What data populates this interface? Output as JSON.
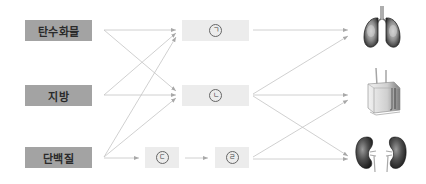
{
  "diagram": {
    "nutrients": [
      {
        "id": "carbohydrate",
        "label": "탄수화물"
      },
      {
        "id": "fat",
        "label": "지방"
      },
      {
        "id": "protein",
        "label": "단백질"
      }
    ],
    "blanks": [
      {
        "id": "giyeok",
        "label": "ㄱ"
      },
      {
        "id": "nieun",
        "label": "ㄴ"
      },
      {
        "id": "digeut",
        "label": "ㄷ"
      },
      {
        "id": "rieul",
        "label": "ㄹ"
      }
    ],
    "organs": [
      {
        "id": "lungs",
        "icon": "lungs-icon"
      },
      {
        "id": "skin",
        "icon": "skin-icon"
      },
      {
        "id": "kidneys",
        "icon": "kidneys-icon"
      }
    ],
    "edges": [
      [
        "탄수화물",
        "ㄱ"
      ],
      [
        "탄수화물",
        "ㄴ"
      ],
      [
        "지방",
        "ㄱ"
      ],
      [
        "지방",
        "ㄴ"
      ],
      [
        "단백질",
        "ㄱ"
      ],
      [
        "단백질",
        "ㄴ"
      ],
      [
        "단백질",
        "ㄷ"
      ],
      [
        "ㄷ",
        "ㄹ"
      ],
      [
        "ㄱ",
        "lungs"
      ],
      [
        "ㄴ",
        "lungs"
      ],
      [
        "ㄴ",
        "skin"
      ],
      [
        "ㄴ",
        "kidneys"
      ],
      [
        "ㄹ",
        "skin"
      ],
      [
        "ㄹ",
        "kidneys"
      ]
    ],
    "colors": {
      "nutrient_box": "#a3a3a3",
      "blank_box": "#ececec",
      "arrow": "#bdbdbd"
    }
  }
}
